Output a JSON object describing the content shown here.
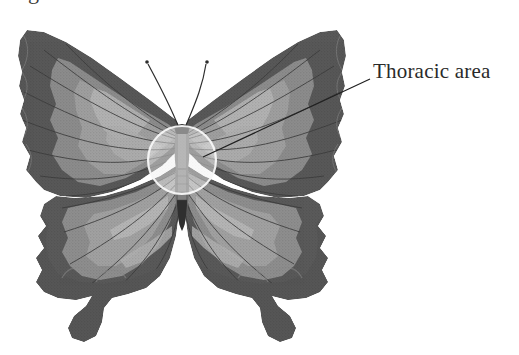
{
  "figure": {
    "view": "dorsal, wings spread",
    "background_color": "#ffffff",
    "cut_off_caption_fragment": "g",
    "annotations": [
      {
        "id": "thoracic-area",
        "label": "Thoracic area",
        "target_shape": "circle",
        "target_x": 182,
        "target_y": 160,
        "target_radius": 34,
        "leader_from_x": 203,
        "leader_from_y": 157,
        "leader_to_x": 370,
        "leader_to_y": 79,
        "label_x": 373,
        "label_y": 58,
        "text_color": "#2a2a2a",
        "leader_color": "#202020"
      }
    ],
    "palette": {
      "paper": "#ffffff",
      "wing_dark": "#5c5c5c",
      "wing_dark_edge": "#4d4d4d",
      "wing_mid": "#7d7d7d",
      "wing_light": "#9a9a9a",
      "wing_pale": "#b0b0b0",
      "vein": "#3f3f3f",
      "body_dark": "#3a3a3a",
      "body_mid": "#6d6d6d",
      "highlight_circle_fill": "#e9e9e9",
      "highlight_circle_stroke": "#f4f4f4",
      "antenna": "#2e2e2e"
    },
    "parts": [
      "left forewing",
      "right forewing",
      "left hindwing",
      "right hindwing",
      "thorax",
      "abdomen",
      "antennae",
      "hindwing tails"
    ]
  }
}
